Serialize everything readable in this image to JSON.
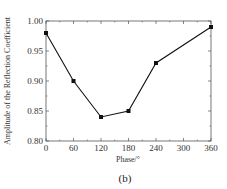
{
  "chart_data": {
    "type": "line",
    "title": "",
    "xlabel": "Phase/°",
    "ylabel": "Amplitude of the Reflection Coefficient",
    "caption": "(b)",
    "x": [
      0,
      60,
      120,
      180,
      240,
      360
    ],
    "series": [
      {
        "name": "Amplitude",
        "values": [
          0.98,
          0.9,
          0.84,
          0.85,
          0.93,
          0.99
        ],
        "marker": "square",
        "color": "#111111"
      }
    ],
    "xlim": [
      0,
      360
    ],
    "ylim": [
      0.8,
      1.0
    ],
    "xticks": [
      "0",
      "60",
      "120",
      "180",
      "240",
      "300",
      "360"
    ],
    "yticks": [
      "0.80",
      "0.85",
      "0.90",
      "0.95",
      "1.00"
    ],
    "grid": false,
    "legend": "none"
  }
}
